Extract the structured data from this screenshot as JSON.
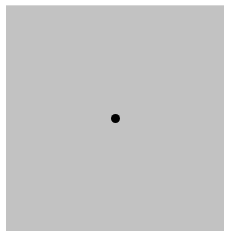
{
  "stimulus": {
    "background_color": "#ffffff",
    "field": {
      "color": "#c2c2c2",
      "left": 6,
      "top": 5,
      "width": 218,
      "height": 226
    },
    "dot": {
      "shape": "circle",
      "color": "#000000",
      "center_x": 115.5,
      "center_y": 118.5,
      "diameter": 9
    }
  }
}
